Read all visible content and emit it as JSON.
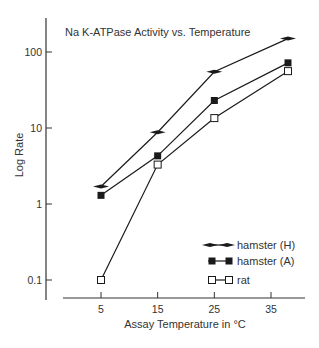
{
  "chart_data": {
    "type": "line",
    "title": "Na K-ATPase Activity vs. Temperature",
    "xlabel": "Assay Temperature in °C",
    "ylabel": "Log Rate",
    "yscale": "log",
    "ylim": [
      0.06,
      200
    ],
    "xlim": [
      -3,
      42
    ],
    "xticks": [
      5,
      15,
      25,
      35
    ],
    "xtick_labels": [
      "5",
      "15",
      "25",
      "35"
    ],
    "yticks": [
      0.1,
      1,
      10,
      100
    ],
    "ytick_labels": [
      "0.1",
      "1",
      "10",
      "100"
    ],
    "grid": false,
    "legend_position": "lower right",
    "x": [
      5,
      15,
      25,
      38
    ],
    "series": [
      {
        "name": "hamster (H)",
        "marker": "flat-diamond",
        "values": [
          1.7,
          8.8,
          55,
          150
        ]
      },
      {
        "name": "hamster (A)",
        "marker": "filled-square",
        "values": [
          1.3,
          4.3,
          23,
          72
        ]
      },
      {
        "name": "rat",
        "marker": "open-square",
        "values": [
          0.1,
          3.3,
          13.5,
          56
        ]
      }
    ]
  },
  "colors": {
    "line": "#1a1a1a",
    "text": "#333333",
    "background": "#ffffff"
  }
}
